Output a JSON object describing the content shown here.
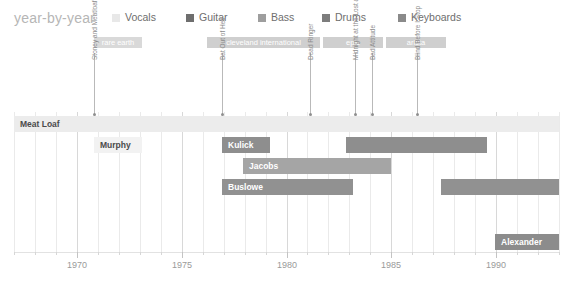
{
  "header": {
    "title": "year-by-year"
  },
  "legend": {
    "items": [
      {
        "label": "Vocals",
        "color": "#e8e8e8",
        "x": 112
      },
      {
        "label": "Guitar",
        "color": "#6e6e6e",
        "x": 186
      },
      {
        "label": "Bass",
        "color": "#9e9e9e",
        "x": 258
      },
      {
        "label": "Drums",
        "color": "#7d7d7d",
        "x": 322
      },
      {
        "label": "Keyboards",
        "color": "#8a8a8a",
        "x": 398
      }
    ]
  },
  "eras": [
    {
      "label": "rare earth",
      "color": "#d9d9d9",
      "x": 94,
      "width": 48
    },
    {
      "label": "cleveland international",
      "color": "#cfcfcf",
      "x": 207,
      "width": 113
    },
    {
      "label": "epic",
      "color": "#cfcfcf",
      "x": 323,
      "width": 60
    },
    {
      "label": "arista",
      "color": "#cfcfcf",
      "x": 386,
      "width": 60
    }
  ],
  "albums": [
    {
      "label": "Stoney and Meatloaf",
      "x": 94,
      "top": 53,
      "height": 62
    },
    {
      "label": "Bat Out of Hell",
      "x": 222,
      "top": 53,
      "height": 62
    },
    {
      "label": "Dead Ringer",
      "x": 310,
      "top": 53,
      "height": 62
    },
    {
      "label": "Midnight at the Lost and Found",
      "x": 355,
      "top": 53,
      "height": 62
    },
    {
      "label": "Bad Attitude",
      "x": 372,
      "top": 53,
      "height": 62
    },
    {
      "label": "Blind Before I Stop",
      "x": 417,
      "top": 53,
      "height": 62
    }
  ],
  "axis": {
    "year_min": 1967,
    "year_max": 1993,
    "major_labels": [
      "1970",
      "1975",
      "1980",
      "1985",
      "1990"
    ],
    "major_years": [
      1970,
      1975,
      1980,
      1985,
      1990
    ]
  },
  "bars": [
    {
      "name": "Meat Loaf",
      "role": "Vocals",
      "x": 14,
      "width": 545,
      "y": 116,
      "color": "#ececec",
      "text": "dark",
      "label_show": true
    },
    {
      "name": "Murphy",
      "role": "Guitar",
      "x": 94,
      "width": 48,
      "y": 137,
      "color": "#f2f2f2",
      "text": "dark",
      "label_show": true
    },
    {
      "name": "Kulick",
      "role": "Guitar",
      "x": 222,
      "width": 48,
      "y": 137,
      "color": "#8e8e8e",
      "text": "light",
      "label_show": true
    },
    {
      "name": "Kulick-gap",
      "role": "Guitar",
      "x": 272,
      "width": 72,
      "y": 137,
      "color": "#9a9a9a",
      "text": "light",
      "label_show": false,
      "hatched": true
    },
    {
      "name": "Kulick-end",
      "role": "Guitar",
      "x": 346,
      "width": 141,
      "y": 137,
      "color": "#8e8e8e",
      "text": "light",
      "label_show": false
    },
    {
      "name": "Jacobs",
      "role": "Bass",
      "x": 243,
      "width": 148,
      "y": 158,
      "color": "#a5a5a5",
      "text": "light",
      "label_show": true
    },
    {
      "name": "Buslowe",
      "role": "Drums",
      "x": 222,
      "width": 131,
      "y": 179,
      "color": "#919191",
      "text": "light",
      "label_show": true
    },
    {
      "name": "Buslowe-gap",
      "role": "Drums",
      "x": 355,
      "width": 85,
      "y": 179,
      "color": "#9c9c9c",
      "text": "light",
      "label_show": false,
      "hatched": true
    },
    {
      "name": "Buslowe-end",
      "role": "Drums",
      "x": 441,
      "width": 118,
      "y": 179,
      "color": "#919191",
      "text": "light",
      "label_show": false
    },
    {
      "name": "Alexander",
      "role": "Keyboards",
      "x": 495,
      "width": 64,
      "y": 234,
      "color": "#8c8c8c",
      "text": "light",
      "label_show": true
    }
  ],
  "chart_data": {
    "type": "bar",
    "title": "year-by-year",
    "xlabel": "",
    "ylabel": "",
    "xlim": [
      1967,
      1993
    ],
    "grid": true,
    "legend_position": "top",
    "categories": [
      "Vocals",
      "Guitar",
      "Bass",
      "Drums",
      "Keyboards"
    ],
    "series": [
      {
        "name": "Meat Loaf",
        "role": "Vocals",
        "start": 1967.0,
        "end": 1993.0
      },
      {
        "name": "Murphy",
        "role": "Guitar",
        "start": 1970.8,
        "end": 1973.1
      },
      {
        "name": "Kulick",
        "role": "Guitar",
        "start": 1976.9,
        "end": 1989.5
      },
      {
        "name": "Jacobs",
        "role": "Bass",
        "start": 1977.9,
        "end": 1984.9
      },
      {
        "name": "Buslowe",
        "role": "Drums",
        "start": 1976.9,
        "end": 1987.8
      },
      {
        "name": "Alexander",
        "role": "Keyboards",
        "start": 1989.9,
        "end": 1993.0
      }
    ],
    "eras": [
      {
        "label": "rare earth",
        "start": 1970.8,
        "end": 1973.1
      },
      {
        "label": "cleveland international",
        "start": 1976.9,
        "end": 1982.3
      },
      {
        "label": "epic",
        "start": 1982.5,
        "end": 1985.4
      },
      {
        "label": "arista",
        "start": 1985.5,
        "end": 1988.3
      }
    ],
    "albums": [
      {
        "label": "Stoney and Meatloaf",
        "year": 1970.8
      },
      {
        "label": "Bat Out of Hell",
        "year": 1976.9
      },
      {
        "label": "Dead Ringer",
        "year": 1981.1
      },
      {
        "label": "Midnight at the Lost and Found",
        "year": 1983.2
      },
      {
        "label": "Bad Attitude",
        "year": 1984.1
      },
      {
        "label": "Blind Before I Stop",
        "year": 1986.2
      }
    ]
  }
}
